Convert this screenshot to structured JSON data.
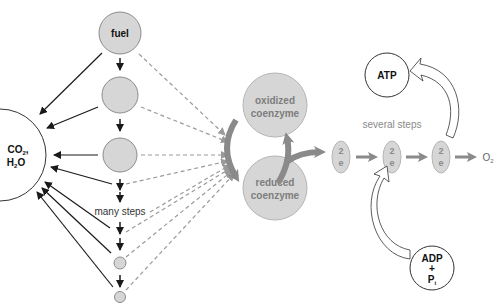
{
  "diagram": {
    "pathway": {
      "fuel_label": "fuel",
      "many_steps_label": "many steps"
    },
    "products": {
      "co2_label": "CO",
      "co2_sub": "2",
      "comma": ",",
      "h2o_label_h": "H",
      "h2o_sub": "2",
      "h2o_label_o": "O"
    },
    "coenzymes": {
      "oxidized_line1": "oxidized",
      "oxidized_line2": "coenzyme",
      "reduced_line1": "reduced",
      "reduced_line2": "coenzyme"
    },
    "electron_transport": {
      "several_steps_label": "several steps",
      "carriers": [
        {
          "top": "2",
          "bottom": "e"
        },
        {
          "top": "2",
          "bottom": "e"
        },
        {
          "top": "2",
          "bottom": "e"
        }
      ],
      "acceptor_label": "O",
      "acceptor_sub": "2"
    },
    "energy": {
      "atp_label": "ATP",
      "adp_label": "ADP",
      "plus_label": "+",
      "pi_label": "P",
      "pi_sub": "i"
    },
    "colors": {
      "circle_fill": "#d6d6d6",
      "circle_stroke": "#8c8c8c",
      "dark_arrow": "#1a1a1a",
      "dashed_arrow": "#9a9a9a",
      "coenzyme_arrow": "#8a8a8a",
      "coenzyme_text": "#7d7d7d"
    }
  }
}
